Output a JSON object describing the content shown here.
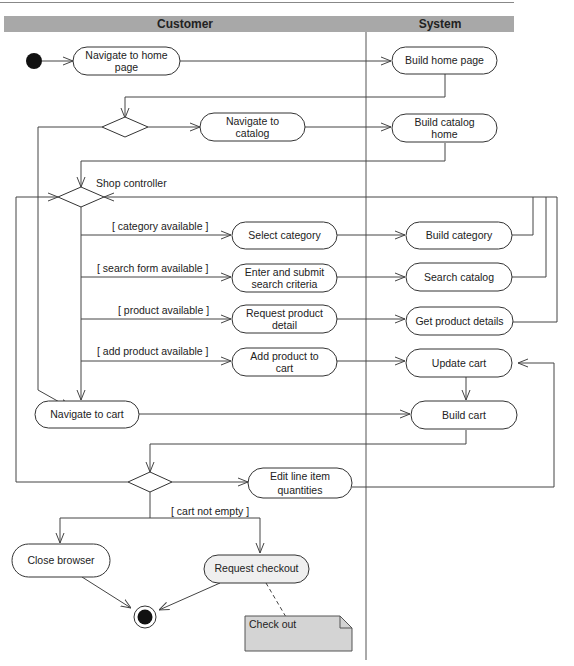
{
  "diagram": {
    "type": "UML activity diagram",
    "swimlanes": [
      {
        "id": "customer",
        "label": "Customer"
      },
      {
        "id": "system",
        "label": "System"
      }
    ],
    "colors": {
      "header_bg": "#a8a8a8",
      "note_bg": "#d4d4d4",
      "line": "#444444"
    },
    "activities": {
      "nav_home": [
        "Navigate to home",
        "page"
      ],
      "build_home": [
        "Build home page"
      ],
      "nav_catalog": [
        "Navigate to",
        "catalog"
      ],
      "build_catalog": [
        "Build catalog",
        "home"
      ],
      "select_category": [
        "Select category"
      ],
      "build_category": [
        "Build category"
      ],
      "enter_search": [
        "Enter and submit",
        "search criteria"
      ],
      "search_catalog": [
        "Search catalog"
      ],
      "request_detail": [
        "Request product",
        "detail"
      ],
      "get_details": [
        "Get product details"
      ],
      "add_product": [
        "Add product to",
        "cart"
      ],
      "update_cart": [
        "Update cart"
      ],
      "nav_cart": [
        "Navigate to cart"
      ],
      "build_cart": [
        "Build cart"
      ],
      "edit_qty": [
        "Edit line item",
        "quantities"
      ],
      "close_browser": [
        "Close browser"
      ],
      "request_checkout": [
        "Request checkout"
      ]
    },
    "labels": {
      "shop_controller": "Shop controller",
      "guard_category": "[ category available ]",
      "guard_search": "[ search form available ]",
      "guard_product": "[ product available ]",
      "guard_add": "[ add product available ]",
      "guard_cart": "[ cart not empty ]"
    },
    "note": {
      "text": "Check out"
    }
  }
}
